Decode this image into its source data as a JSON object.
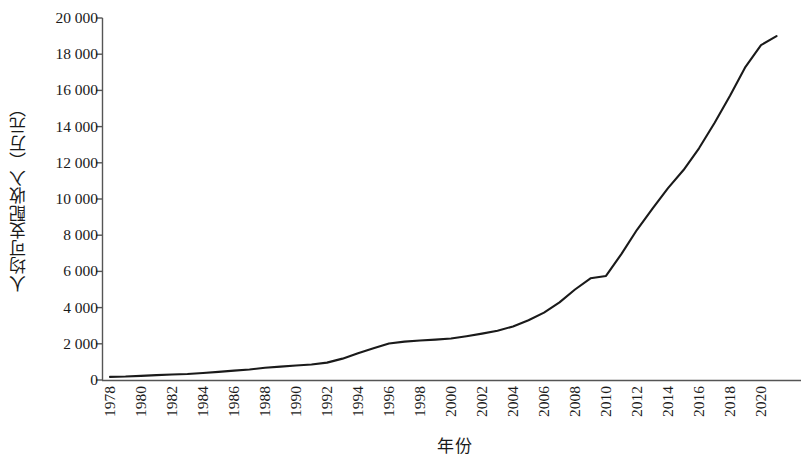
{
  "chart_data": {
    "type": "line",
    "title": "",
    "subtitle": "",
    "xlabel": "年份",
    "ylabel": "人均可支配收入（万元）",
    "xlim": [
      1978,
      2021
    ],
    "ylim": [
      0,
      20000
    ],
    "ytick_labels": [
      "20 000",
      "18 000",
      "16 000",
      "14 000",
      "12 000",
      "10 000",
      "8 000",
      "6 000",
      "4 000",
      "2 000",
      "0"
    ],
    "ytick_values": [
      20000,
      18000,
      16000,
      14000,
      12000,
      10000,
      8000,
      6000,
      4000,
      2000,
      0
    ],
    "xtick_labels": [
      "1978",
      "1980",
      "1982",
      "1984",
      "1986",
      "1988",
      "1990",
      "1992",
      "1994",
      "1996",
      "1998",
      "2000",
      "2002",
      "2004",
      "2006",
      "2008",
      "2010",
      "2012",
      "2014",
      "2016",
      "2018",
      "2020"
    ],
    "xtick_values": [
      1978,
      1980,
      1982,
      1984,
      1986,
      1988,
      1990,
      1992,
      1994,
      1996,
      1998,
      2000,
      2002,
      2004,
      2006,
      2008,
      2010,
      2012,
      2014,
      2016,
      2018,
      2020
    ],
    "grid": false,
    "legend": null,
    "legend_position": "none",
    "line_color": "#1a1a1a",
    "axis_color": "#555555",
    "series": [
      {
        "name": "人均可支配收入",
        "x": [
          1978,
          1979,
          1980,
          1981,
          1982,
          1983,
          1984,
          1985,
          1986,
          1987,
          1988,
          1989,
          1990,
          1991,
          1992,
          1993,
          1994,
          1995,
          1996,
          1997,
          1998,
          1999,
          2000,
          2001,
          2002,
          2003,
          2004,
          2005,
          2006,
          2007,
          2008,
          2009,
          2010,
          2011,
          2012,
          2013,
          2014,
          2015,
          2016,
          2017,
          2018,
          2019,
          2020,
          2021
        ],
        "values": [
          171,
          190,
          230,
          270,
          300,
          330,
          390,
          450,
          520,
          580,
          680,
          740,
          800,
          860,
          960,
          1180,
          1480,
          1750,
          2020,
          2120,
          2180,
          2230,
          2290,
          2420,
          2560,
          2720,
          2960,
          3300,
          3720,
          4290,
          5000,
          5620,
          5750,
          6970,
          8300,
          9470,
          10600,
          11600,
          12800,
          14200,
          15700,
          17300,
          18500,
          19000
        ]
      }
    ]
  }
}
